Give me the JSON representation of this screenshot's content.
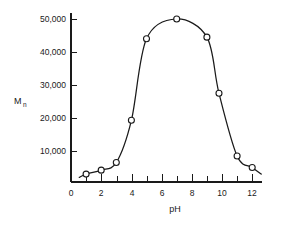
{
  "chart_data": {
    "type": "line",
    "title": "",
    "xlabel": "pH",
    "ylabel": "Mn",
    "ylabel_base": "M",
    "ylabel_subscript": "n",
    "xlim": [
      0,
      12.6
    ],
    "ylim": [
      0,
      53000
    ],
    "grid": false,
    "legend": null,
    "x_ticks_labeled": [
      0,
      2,
      4,
      6,
      8,
      10,
      12
    ],
    "x_tick_labels": [
      "0",
      "2",
      "4",
      "6",
      "8",
      "10",
      "12"
    ],
    "x_ticks_minor": [
      1,
      3,
      5,
      7,
      9,
      11
    ],
    "y_ticks_labeled": [
      10000,
      20000,
      30000,
      40000,
      50000
    ],
    "y_tick_labels": [
      "10,000",
      "20,000",
      "30,000",
      "40,000",
      "50,000"
    ],
    "marker_style": "open-circle",
    "line_color": "#1a1a1a",
    "marker_fill": "#ffffff",
    "x": [
      1.0,
      2.0,
      3.0,
      4.0,
      5.0,
      7.0,
      9.0,
      9.8,
      11.0,
      12.0
    ],
    "values": [
      3000,
      4200,
      6500,
      19300,
      44000,
      50000,
      44500,
      27500,
      8500,
      5000
    ],
    "points": [
      {
        "x": 1.0,
        "y": 3000
      },
      {
        "x": 2.0,
        "y": 4200
      },
      {
        "x": 3.0,
        "y": 6500
      },
      {
        "x": 4.0,
        "y": 19300
      },
      {
        "x": 5.0,
        "y": 44000
      },
      {
        "x": 7.0,
        "y": 50000
      },
      {
        "x": 9.0,
        "y": 44500
      },
      {
        "x": 9.8,
        "y": 27500
      },
      {
        "x": 11.0,
        "y": 8500
      },
      {
        "x": 12.0,
        "y": 5000
      }
    ]
  }
}
